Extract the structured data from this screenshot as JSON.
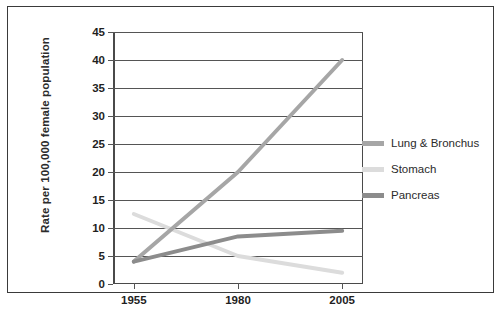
{
  "chart_data": {
    "type": "line",
    "title": "",
    "xlabel": "",
    "ylabel": "Rate per 100,000 female population",
    "x": [
      1955,
      1980,
      2005
    ],
    "xtick_labels": [
      "1955",
      "1980",
      "2005"
    ],
    "ytick_labels": [
      "0",
      "5",
      "10",
      "15",
      "20",
      "25",
      "30",
      "35",
      "40",
      "45"
    ],
    "ytick_values": [
      0,
      5,
      10,
      15,
      20,
      25,
      30,
      35,
      40,
      45
    ],
    "ylim": [
      0,
      45
    ],
    "xlim": [
      1950,
      2010
    ],
    "grid": "horizontal",
    "legend_position": "right-outside",
    "series": [
      {
        "name": "Lung & Bronchus",
        "values": [
          4,
          20,
          40
        ],
        "color": "#a6a6a6"
      },
      {
        "name": "Stomach",
        "values": [
          12.5,
          5,
          2
        ],
        "color": "#dcdcdc"
      },
      {
        "name": "Pancreas",
        "values": [
          4,
          8.5,
          9.5
        ],
        "color": "#8c8c8c"
      }
    ]
  },
  "legend": {
    "items": [
      {
        "label": "Lung & Bronchus",
        "color": "#a6a6a6"
      },
      {
        "label": "Stomach",
        "color": "#dcdcdc"
      },
      {
        "label": "Pancreas",
        "color": "#8c8c8c"
      }
    ]
  },
  "caption": ""
}
